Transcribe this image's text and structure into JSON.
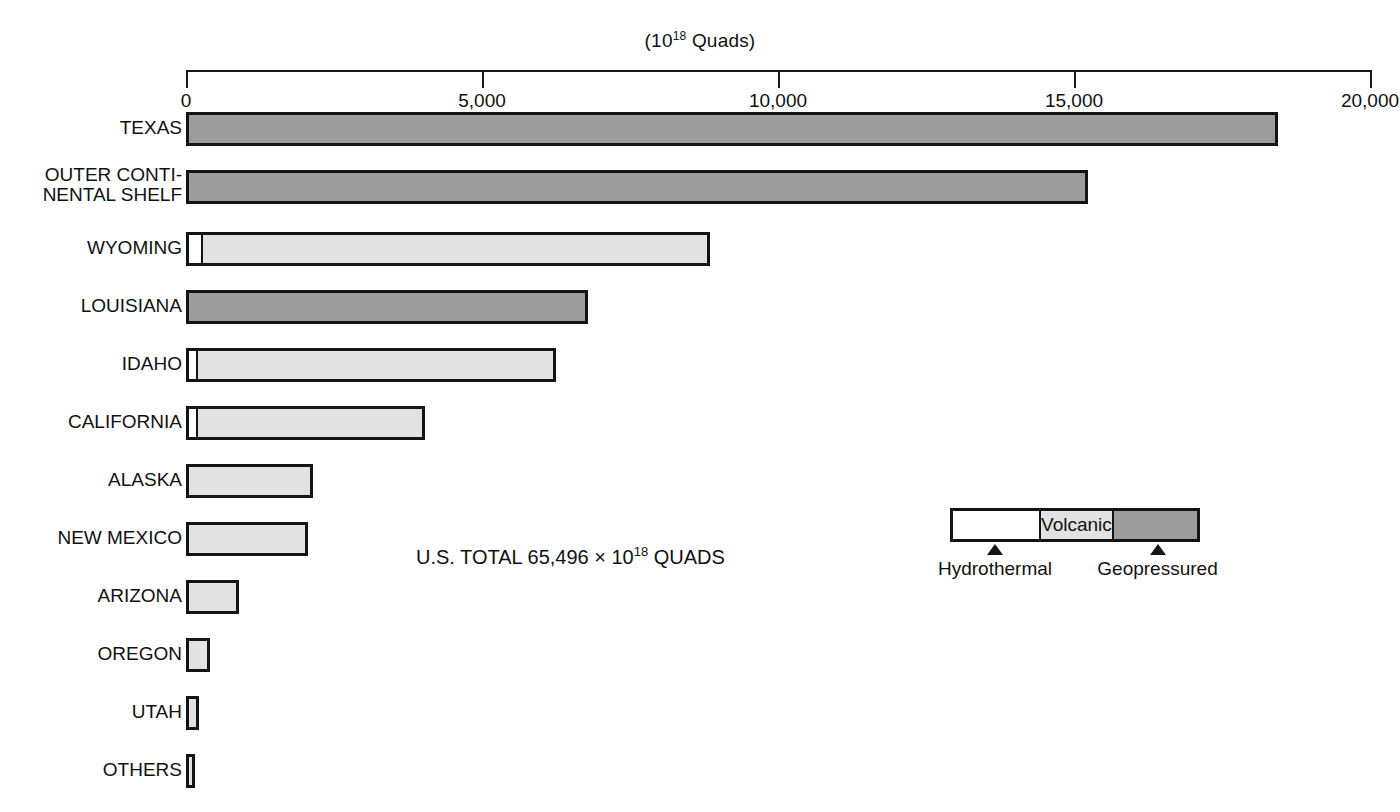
{
  "chart_data": {
    "type": "bar",
    "orientation": "horizontal",
    "title_prefix": "(10",
    "title_sup": "18",
    "title_suffix": " Quads)",
    "xlabel": "",
    "ylabel": "",
    "xlim": [
      0,
      20000
    ],
    "grid": false,
    "ticks": [
      {
        "value": 0,
        "label": "0"
      },
      {
        "value": 5000,
        "label": "5,000"
      },
      {
        "value": 10000,
        "label": "10,000"
      },
      {
        "value": 15000,
        "label": "15,000"
      },
      {
        "value": 20000,
        "label": "20,000"
      }
    ],
    "categories": [
      "TEXAS",
      "OUTER CONTI-\nNENTAL SHELF",
      "WYOMING",
      "LOUISIANA",
      "IDAHO",
      "CALIFORNIA",
      "ALASKA",
      "NEW MEXICO",
      "ARIZONA",
      "OREGON",
      "UTAH",
      "OTHERS"
    ],
    "series": [
      {
        "name": "Hydrothermal",
        "color": "#ffffff",
        "values": [
          0,
          0,
          240,
          0,
          160,
          150,
          0,
          0,
          0,
          0,
          0,
          0
        ]
      },
      {
        "name": "Volcanic",
        "color": "#e2e2e2",
        "values": [
          0,
          0,
          8610,
          0,
          6090,
          3890,
          2150,
          2060,
          900,
          400,
          220,
          150
        ]
      },
      {
        "name": "Geopressured",
        "color": "#9c9c9c",
        "values": [
          18440,
          15240,
          0,
          6790,
          0,
          0,
          0,
          0,
          0,
          0,
          0,
          0
        ]
      }
    ],
    "totals": [
      18440,
      15240,
      8850,
      6790,
      6250,
      4040,
      2150,
      2060,
      900,
      400,
      220,
      150
    ],
    "annotations": {
      "total_note_prefix": "U.S. TOTAL 65,496 ",
      "total_note_times": "×",
      "total_note_mid": " 10",
      "total_note_sup": "18",
      "total_note_suffix": " QUADS"
    },
    "legend": {
      "position": "inside-right",
      "volcanic_label": "Volcanic",
      "hydrothermal_label": "Hydrothermal",
      "geopressured_label": "Geopressured"
    }
  },
  "rows": [
    {
      "label": "TEXAS",
      "y": 112,
      "segments": [
        {
          "type": "geopressured",
          "value": 18440
        }
      ]
    },
    {
      "label": "OUTER CONTI-\nNENTAL SHELF",
      "y": 170,
      "two_line": true,
      "segments": [
        {
          "type": "geopressured",
          "value": 15240
        }
      ]
    },
    {
      "label": "WYOMING",
      "y": 232,
      "segments": [
        {
          "type": "hydrothermal",
          "value": 240
        },
        {
          "type": "volcanic",
          "value": 8610
        }
      ]
    },
    {
      "label": "LOUISIANA",
      "y": 290,
      "segments": [
        {
          "type": "geopressured",
          "value": 6790
        }
      ]
    },
    {
      "label": "IDAHO",
      "y": 348,
      "segments": [
        {
          "type": "hydrothermal",
          "value": 160
        },
        {
          "type": "volcanic",
          "value": 6090
        }
      ]
    },
    {
      "label": "CALIFORNIA",
      "y": 406,
      "segments": [
        {
          "type": "hydrothermal",
          "value": 150
        },
        {
          "type": "volcanic",
          "value": 3890
        }
      ]
    },
    {
      "label": "ALASKA",
      "y": 464,
      "segments": [
        {
          "type": "volcanic",
          "value": 2150
        }
      ]
    },
    {
      "label": "NEW MEXICO",
      "y": 522,
      "segments": [
        {
          "type": "volcanic",
          "value": 2060
        }
      ]
    },
    {
      "label": "ARIZONA",
      "y": 580,
      "segments": [
        {
          "type": "volcanic",
          "value": 900
        }
      ]
    },
    {
      "label": "OREGON",
      "y": 638,
      "segments": [
        {
          "type": "volcanic",
          "value": 400
        }
      ]
    },
    {
      "label": "UTAH",
      "y": 696,
      "segments": [
        {
          "type": "volcanic",
          "value": 220
        }
      ]
    },
    {
      "label": "OTHERS",
      "y": 754,
      "segments": [
        {
          "type": "volcanic",
          "value": 150
        }
      ]
    }
  ],
  "colors": {
    "hydrothermal": "#ffffff",
    "volcanic": "#e2e2e2",
    "geopressured": "#9c9c9c",
    "outline": "#141414",
    "background": "#ffffff"
  }
}
